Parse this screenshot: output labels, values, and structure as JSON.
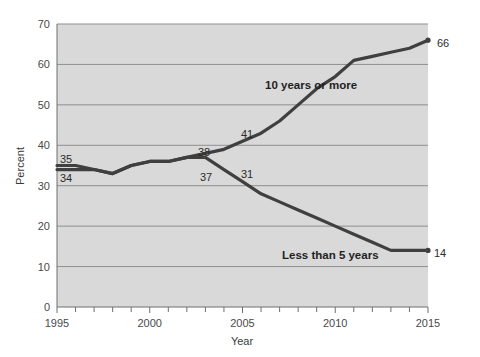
{
  "chart_data": {
    "type": "line",
    "title": "",
    "subtitle": "",
    "xlabel": "Year",
    "ylabel": "Percent",
    "xlim": [
      1995,
      2015
    ],
    "ylim": [
      0,
      70
    ],
    "grid": "horizontal",
    "legend_position": "inline-annotations",
    "x": [
      1995,
      1996,
      1997,
      1998,
      1999,
      2000,
      2001,
      2002,
      2003,
      2004,
      2005,
      2006,
      2007,
      2008,
      2009,
      2010,
      2011,
      2012,
      2013,
      2014,
      2015
    ],
    "yticks": [
      0,
      10,
      20,
      30,
      40,
      50,
      60,
      70
    ],
    "ytick_labels": [
      "0",
      "10",
      "20",
      "30",
      "40",
      "50",
      "60",
      "70"
    ],
    "xticks": [
      1995,
      2000,
      2005,
      2010,
      2015
    ],
    "xtick_labels": [
      "1995",
      "2000",
      "2005",
      "2010",
      "2015"
    ],
    "minor_xticks_every": 1,
    "series": [
      {
        "name": "10 years or more",
        "color": "#3f3f3f",
        "values": [
          34,
          34,
          34,
          33,
          35,
          36,
          36,
          37,
          38,
          39,
          41,
          43,
          46,
          50,
          54,
          57,
          61,
          62,
          63,
          64,
          66
        ],
        "endpoint_value": 66,
        "annotations": [
          {
            "label": "38",
            "x": 2003,
            "y": 38
          },
          {
            "label": "41",
            "x": 2005,
            "y": 41
          },
          {
            "label": "34",
            "x": 1995,
            "y": 34
          },
          {
            "label": "66",
            "x": 2015,
            "y": 66
          }
        ]
      },
      {
        "name": "Less than 5 years",
        "color": "#3f3f3f",
        "values": [
          35,
          35,
          34,
          33,
          35,
          36,
          36,
          37,
          37,
          34,
          31,
          28,
          26,
          24,
          22,
          20,
          18,
          16,
          14,
          14,
          14
        ],
        "endpoint_value": 14,
        "annotations": [
          {
            "label": "35",
            "x": 1995,
            "y": 35
          },
          {
            "label": "37",
            "x": 2003,
            "y": 37
          },
          {
            "label": "31",
            "x": 2005,
            "y": 31
          },
          {
            "label": "14",
            "x": 2015,
            "y": 14
          }
        ]
      }
    ],
    "colors": {
      "plot_background": "#d9d9d9",
      "page_background": "#ffffff",
      "gridline": "#8f8f8f",
      "axis": "#6e6e6e",
      "line": "#3f3f3f",
      "text": "#2b2b2b"
    }
  },
  "axes": {
    "y_title": "Percent",
    "x_title": "Year",
    "y_tick_0": "0",
    "y_tick_10": "10",
    "y_tick_20": "20",
    "y_tick_30": "30",
    "y_tick_40": "40",
    "y_tick_50": "50",
    "y_tick_60": "60",
    "y_tick_70": "70",
    "x_tick_1995": "1995",
    "x_tick_2000": "2000",
    "x_tick_2005": "2005",
    "x_tick_2010": "2010",
    "x_tick_2015": "2015"
  },
  "annotations": {
    "series_top_label": "10 years or more",
    "series_bottom_label": "Less than 5 years",
    "value_35": "35",
    "value_34": "34",
    "value_38": "38",
    "value_41": "41",
    "value_37": "37",
    "value_31": "31",
    "value_66": "66",
    "value_14": "14"
  }
}
